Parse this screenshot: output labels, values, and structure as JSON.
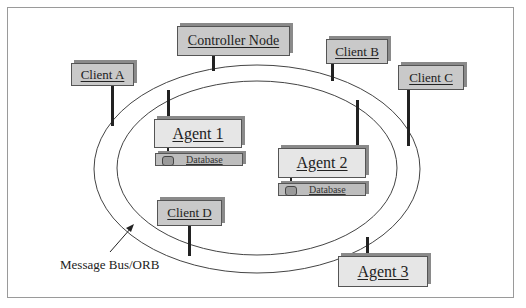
{
  "diagram": {
    "title": "",
    "bus_label": "Message Bus/ORB",
    "nodes": {
      "controller": "Controller Node",
      "client_a": "Client A",
      "client_b": "Client B",
      "client_c": "Client C",
      "client_d": "Client D",
      "agent_1": "Agent 1",
      "agent_2": "Agent 2",
      "agent_3": "Agent 3"
    },
    "databases": {
      "agent_1_db": "Database",
      "agent_2_db": "Database"
    },
    "colors": {
      "client_fill": "#c9c9c9",
      "agent_fill": "#e6e6e6",
      "database_fill": "#bdbdbd",
      "line": "#222222"
    }
  }
}
